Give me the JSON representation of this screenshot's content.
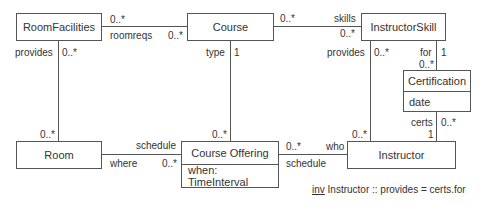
{
  "diagram": {
    "type": "UML class diagram",
    "classes": [
      {
        "id": "roomfacilities",
        "name": "RoomFacilities",
        "attributes": []
      },
      {
        "id": "course",
        "name": "Course",
        "attributes": []
      },
      {
        "id": "instructorskill",
        "name": "InstructorSkill",
        "attributes": []
      },
      {
        "id": "certification",
        "name": "Certification",
        "attributes": [
          "date"
        ]
      },
      {
        "id": "room",
        "name": "Room",
        "attributes": []
      },
      {
        "id": "courseoffering",
        "name": "Course Offering",
        "attributes": [
          "when: TimeInterval"
        ]
      },
      {
        "id": "instructor",
        "name": "Instructor",
        "attributes": []
      }
    ],
    "associations": [
      {
        "from": "RoomFacilities",
        "to": "Course",
        "from_mult": "0..*",
        "to_role": "roomreqs",
        "to_mult": "0..*"
      },
      {
        "from": "Course",
        "to": "InstructorSkill",
        "from_mult": "0..*",
        "to_role": "skills",
        "to_mult": "0..*"
      },
      {
        "from": "RoomFacilities",
        "to": "Room",
        "from_role": "provides",
        "from_mult": "0..*",
        "to_mult": "0..*"
      },
      {
        "from": "Course",
        "to": "Course Offering",
        "from_role": "type",
        "from_mult": "1",
        "to_mult": "0..*"
      },
      {
        "from": "InstructorSkill",
        "to": "Instructor",
        "from_role": "provides",
        "from_mult": "0..*",
        "to_mult": "0..*"
      },
      {
        "from": "InstructorSkill",
        "to": "Certification",
        "from_role": "for",
        "from_mult": "1",
        "to_mult": "0..*"
      },
      {
        "from": "Certification",
        "to": "Instructor",
        "from_role": "certs",
        "from_mult": "0..*",
        "to_mult": "1"
      },
      {
        "from": "Room",
        "to": "Course Offering",
        "from_role": "where",
        "to_role": "schedule",
        "to_mult": "0..*"
      },
      {
        "from": "Course Offering",
        "to": "Instructor",
        "from_mult": "0..*",
        "from_role": "schedule",
        "to_role": "who"
      }
    ],
    "labels": {
      "rf_course_mult_left": "0..*",
      "rf_course_role": "roomreqs",
      "rf_course_mult_right": "0..*",
      "course_skill_mult_left": "0..*",
      "course_skill_role": "skills",
      "course_skill_mult_right": "0..*",
      "rf_room_role": "provides",
      "rf_room_mult_top": "0..*",
      "rf_room_mult_bottom": "0..*",
      "course_off_role": "type",
      "course_off_mult_top": "1",
      "course_off_mult_bottom": "0..*",
      "skill_instr_role": "provides",
      "skill_instr_mult_top": "0..*",
      "skill_instr_mult_bottom": "0..*",
      "skill_cert_role": "for",
      "skill_cert_mult_top": "1",
      "skill_cert_mult_bottom": "0..*",
      "cert_instr_role": "certs",
      "cert_instr_mult_top": "0..*",
      "cert_instr_mult_bottom": "1",
      "room_off_role_top": "schedule",
      "room_off_role_bottom": "where",
      "room_off_mult": "0..*",
      "off_instr_mult": "0..*",
      "off_instr_role_top": "who",
      "off_instr_role_bottom": "schedule"
    },
    "invariant": {
      "keyword": "inv",
      "text": " Instructor :: provides = certs.for"
    }
  }
}
